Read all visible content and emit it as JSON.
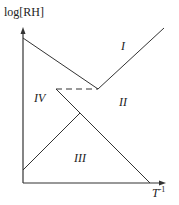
{
  "diagram": {
    "y_axis_label": "log[RH]",
    "x_axis_label": "T",
    "x_axis_superscript": "-1",
    "regions": {
      "I": "I",
      "II": "II",
      "III": "III",
      "IV": "IV"
    },
    "line_color": "#333333",
    "boundaries": [
      {
        "name": "upper-left-descending",
        "from": [
          23,
          38
        ],
        "to": [
          98,
          89
        ],
        "style": "solid"
      },
      {
        "name": "right-ascending",
        "from": [
          98,
          89
        ],
        "to": [
          164,
          28
        ],
        "style": "solid"
      },
      {
        "name": "dashed-horizontal",
        "from": [
          56,
          89
        ],
        "to": [
          98,
          89
        ],
        "style": "dashed"
      },
      {
        "name": "middle-descending",
        "from": [
          56,
          89
        ],
        "to": [
          150,
          183
        ],
        "style": "solid"
      },
      {
        "name": "lower-ascending",
        "from": [
          23,
          170
        ],
        "to": [
          80,
          113
        ],
        "style": "solid"
      }
    ]
  }
}
